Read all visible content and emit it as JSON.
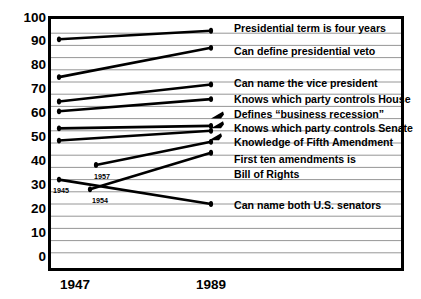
{
  "chart_data": {
    "type": "line",
    "title": "",
    "subtitle": "",
    "xlabel": "",
    "ylabel": "Percentage Correct",
    "x": [
      "1947",
      "1989"
    ],
    "xticklabels": [
      "1947",
      "1989"
    ],
    "ylim": [
      0,
      100
    ],
    "yticklabels": [
      "100",
      "90",
      "80",
      "70",
      "60",
      "50",
      "40",
      "30",
      "20",
      "10",
      "0"
    ],
    "ytick_values": [
      100,
      90,
      80,
      70,
      60,
      50,
      40,
      30,
      20,
      10,
      0
    ],
    "grid": true,
    "grid_interval": 5,
    "legend_position": "right-inline",
    "marker": "circle",
    "line_color": "#000000",
    "series": [
      {
        "name": "Presidential term is four years",
        "x": [
          "1947",
          "1989"
        ],
        "values": [
          92.5,
          96
        ],
        "start_year": "1947",
        "label": "Presidential term is four years",
        "arrow": false
      },
      {
        "name": "Can define presidential veto",
        "x": [
          "1947",
          "1989"
        ],
        "values": [
          77,
          89
        ],
        "start_year": "1947",
        "label": "Can define presidential veto",
        "arrow": false
      },
      {
        "name": "Can name the vice president",
        "x": [
          "1947",
          "1989"
        ],
        "values": [
          67,
          74
        ],
        "start_year": "1947",
        "label": "Can name the vice president",
        "arrow": false
      },
      {
        "name": "Knows which party controls House",
        "x": [
          "1947",
          "1989"
        ],
        "values": [
          63,
          68
        ],
        "start_year": "1947",
        "label": "Knows which party controls House",
        "arrow": false
      },
      {
        "name": "Defines “business recession”",
        "x": [
          "1947",
          "1989"
        ],
        "values": [
          56,
          57
        ],
        "start_year": "1947",
        "label": "Defines “business recession”",
        "arrow": true
      },
      {
        "name": "Knows which party controls Senate",
        "x": [
          "1947",
          "1989"
        ],
        "values": [
          51,
          55
        ],
        "start_year": "1947",
        "label": "Knows which party controls Senate",
        "arrow": true
      },
      {
        "name": "Knowledge of Fifth Amendment",
        "x": [
          "1957",
          "1989"
        ],
        "values": [
          41,
          50.5
        ],
        "start_year": "1957",
        "label": "Knowledge of Fifth Amendment",
        "arrow": true
      },
      {
        "name": "First ten amendments is Bill of Rights",
        "x": [
          "1954",
          "1989"
        ],
        "values": [
          31,
          46
        ],
        "start_year": "1954",
        "label": "First ten amendments is Bill of Rights",
        "arrow": false
      },
      {
        "name": "Can name both U.S. senators",
        "x": [
          "1945",
          "1989"
        ],
        "values": [
          35,
          25
        ],
        "start_year": "1945",
        "label": "Can name both U.S. senators",
        "arrow": false
      }
    ],
    "annotations": [
      {
        "text": "1945",
        "value": 35,
        "note": "start year label for Can name both U.S. senators"
      },
      {
        "text": "1957",
        "value": 41,
        "note": "start year label for Knowledge of Fifth Amendment"
      },
      {
        "text": "1954",
        "value": 31,
        "note": "start year label for First ten amendments is Bill of Rights"
      }
    ]
  },
  "axis": {
    "y_title": "Percentage Correct",
    "y_ticks": [
      "100",
      "90",
      "80",
      "70",
      "60",
      "50",
      "40",
      "30",
      "20",
      "10",
      "0"
    ],
    "x_ticks": [
      "1947",
      "1989"
    ]
  },
  "labels": {
    "l1": "Presidential term is four years",
    "l2": "Can define presidential veto",
    "l3": "Can name the vice president",
    "l4": "Knows which party controls House",
    "l5": "Defines “business recession”",
    "l6": "Knows which party controls Senate",
    "l7": "Knowledge of Fifth Amendment",
    "l8a": "First ten amendments is",
    "l8b": "Bill of Rights",
    "l9": "Can name both U.S. senators"
  },
  "annotations": {
    "a1945": "1945",
    "a1957": "1957",
    "a1954": "1954"
  }
}
